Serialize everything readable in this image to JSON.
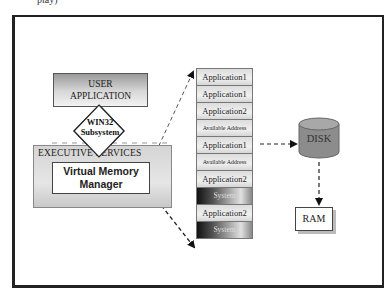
{
  "page": {
    "top_text_fragment": "play)"
  },
  "diagram": {
    "user_application": {
      "line1": "USER",
      "line2": "APPLICATION"
    },
    "subsystem": {
      "line1": "WIN32",
      "line2": "Subsystem"
    },
    "executive_services": {
      "label": "EXECUTIVE SERVICES"
    },
    "virtual_memory_manager": {
      "line1": "Virtual Memory",
      "line2": "Manager"
    },
    "memory_stack": [
      {
        "label": "Application1",
        "type": "app"
      },
      {
        "label": "Application1",
        "type": "app"
      },
      {
        "label": "Application2",
        "type": "app"
      },
      {
        "label": "Available Address",
        "type": "free"
      },
      {
        "label": "Application1",
        "type": "app"
      },
      {
        "label": "Available Address",
        "type": "free"
      },
      {
        "label": "Application2",
        "type": "app"
      },
      {
        "label": "System",
        "type": "system"
      },
      {
        "label": "Application2",
        "type": "app"
      },
      {
        "label": "System",
        "type": "system"
      }
    ],
    "disk": {
      "label": "DISK",
      "color": "#8c8c8c"
    },
    "ram": {
      "label": "RAM"
    },
    "edges": [
      {
        "from": "executive_services",
        "to": "memory_stack.top",
        "style": "dashed-arrow"
      },
      {
        "from": "executive_services",
        "to": "memory_stack.bottom",
        "style": "dashed-arrow"
      },
      {
        "from": "memory_stack",
        "to": "disk",
        "style": "dashed-arrow"
      },
      {
        "from": "disk",
        "to": "ram",
        "style": "dashed-arrow"
      }
    ]
  }
}
